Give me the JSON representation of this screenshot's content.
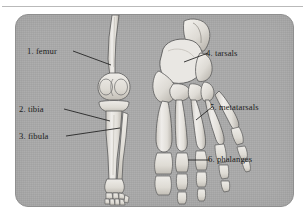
{
  "figure": {
    "panel_background_color": "#a9a9a9",
    "bone_fill_color": "#e8e6e2",
    "bone_outline_color": "#4a4a4a",
    "label_text_color": "#1d1d1d",
    "leader_line_color": "#1d1d1d",
    "top_rule_color": "#b9b9b9"
  },
  "labels": [
    {
      "id": "femur",
      "number": "1.",
      "name": "femur",
      "text": "1. femur",
      "side": "left"
    },
    {
      "id": "tibia",
      "number": "2.",
      "name": "tibia",
      "text": "2. tibia",
      "side": "left"
    },
    {
      "id": "fibula",
      "number": "3.",
      "name": "fibula",
      "text": "3. fibula",
      "side": "left"
    },
    {
      "id": "tarsals",
      "number": "4.",
      "name": "tarsals",
      "text": "4. tarsals",
      "side": "right"
    },
    {
      "id": "metatarsals",
      "number": "5.",
      "name": "metatarsals",
      "text": "5. metatarsals",
      "side": "right"
    },
    {
      "id": "phalanges",
      "number": "6.",
      "name": "phalanges",
      "text": "6. phalanges",
      "side": "right"
    }
  ],
  "illustrations": {
    "leg": {
      "name": "leg-bones-anterior-view",
      "parts": [
        "femur",
        "patella-region",
        "tibia",
        "fibula",
        "ankle",
        "foot-skeleton"
      ]
    },
    "foot": {
      "name": "foot-bones-dorsal-view",
      "parts": [
        "talus",
        "calcaneus",
        "navicular",
        "cuneiforms",
        "cuboid",
        "metatarsals",
        "proximal-phalanges",
        "middle-phalanges",
        "distal-phalanges"
      ]
    }
  }
}
